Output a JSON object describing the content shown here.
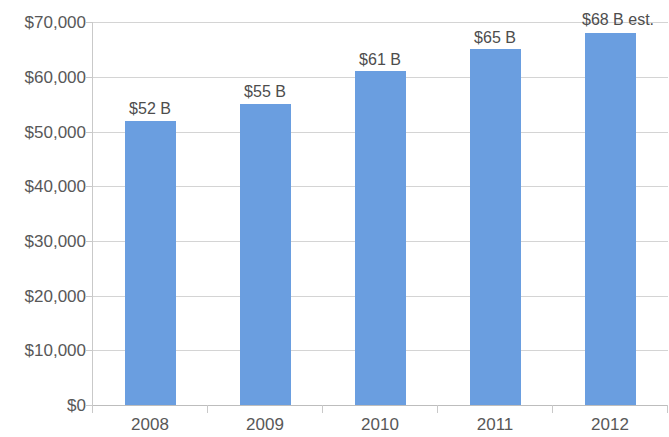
{
  "chart_data": {
    "type": "bar",
    "title": "",
    "subtitle": "",
    "xlabel": "",
    "ylabel": "",
    "categories": [
      "2008",
      "2009",
      "2010",
      "2011",
      "2012"
    ],
    "values": [
      52000,
      55000,
      61000,
      65000,
      68000
    ],
    "data_labels": [
      "$52 B",
      "$55 B",
      "$61 B",
      "$65 B",
      "$68 B est."
    ],
    "ylim": [
      0,
      70000
    ],
    "ytick_values": [
      70000,
      60000,
      50000,
      40000,
      30000,
      20000,
      10000,
      0
    ],
    "ytick_labels": [
      "$70,000",
      "$60,000",
      "$50,000",
      "$40,000",
      "$30,000",
      "$20,000",
      "$10,000",
      "$0"
    ],
    "grid": true,
    "legend": false,
    "legend_position": "none",
    "series": [
      {
        "name": "Value",
        "values": [
          52000,
          55000,
          61000,
          65000,
          68000
        ]
      }
    ],
    "colors": {
      "bar": "#6A9EE0",
      "gridline": "#d4d4d4",
      "axis": "#c9c9c9",
      "text": "#585858",
      "background": "#ffffff"
    }
  }
}
